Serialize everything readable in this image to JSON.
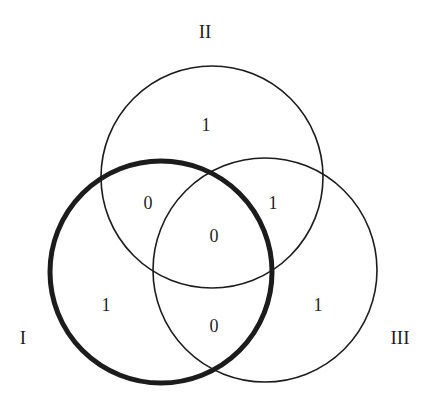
{
  "diagram": {
    "type": "venn",
    "colors": {
      "stroke": "#1c1c1c",
      "text": "#1f1f1f",
      "background": "#ffffff"
    },
    "sets": [
      {
        "id": "I",
        "label": "I",
        "cx": 161,
        "cy": 272,
        "r": 111,
        "stroke_width": 5,
        "emphasized": true
      },
      {
        "id": "II",
        "label": "II",
        "cx": 212,
        "cy": 177,
        "r": 111,
        "stroke_width": 1.6,
        "emphasized": false
      },
      {
        "id": "III",
        "label": "III",
        "cx": 265,
        "cy": 270,
        "r": 112,
        "stroke_width": 1.6,
        "emphasized": false
      }
    ],
    "set_label_positions": {
      "I": {
        "x": 23,
        "y": 344
      },
      "II": {
        "x": 205,
        "y": 38
      },
      "III": {
        "x": 400,
        "y": 344
      }
    },
    "regions": [
      {
        "name": "II only",
        "value": "1",
        "x": 206,
        "y": 131
      },
      {
        "name": "I and II",
        "value": "0",
        "x": 148,
        "y": 209
      },
      {
        "name": "II and III",
        "value": "1",
        "x": 273,
        "y": 209
      },
      {
        "name": "I, II, III",
        "value": "0",
        "x": 214,
        "y": 242
      },
      {
        "name": "I only",
        "value": "1",
        "x": 106,
        "y": 311
      },
      {
        "name": "I and III",
        "value": "0",
        "x": 214,
        "y": 332
      },
      {
        "name": "III only",
        "value": "1",
        "x": 318,
        "y": 311
      }
    ]
  }
}
